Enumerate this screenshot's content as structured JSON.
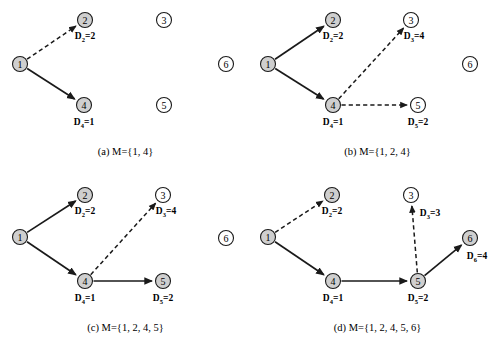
{
  "figure": {
    "colors": {
      "node_filled": "#cfcfcf",
      "node_empty": "#ffffff",
      "stroke": "#1a1a1a",
      "background": "#ffffff"
    },
    "node_radius": 7.5,
    "panels": [
      {
        "id": "a",
        "caption": "(a)  M={1, 4}",
        "nodes": [
          {
            "id": "1",
            "label": "1",
            "x": 20,
            "y": 64,
            "filled": true,
            "dist": null,
            "dist_x": 20,
            "dist_y": 78
          },
          {
            "id": "2",
            "label": "2",
            "x": 85,
            "y": 20,
            "filled": true,
            "dist": "D2=2",
            "dist_sub": "2",
            "dist_val": "2",
            "dist_x": 85,
            "dist_y": 32
          },
          {
            "id": "3",
            "label": "3",
            "x": 164,
            "y": 20,
            "filled": false,
            "dist": null,
            "dist_x": 164,
            "dist_y": 32
          },
          {
            "id": "4",
            "label": "4",
            "x": 84,
            "y": 105,
            "filled": true,
            "dist": "D4=1",
            "dist_sub": "4",
            "dist_val": "1",
            "dist_x": 84,
            "dist_y": 118
          },
          {
            "id": "5",
            "label": "5",
            "x": 164,
            "y": 105,
            "filled": false,
            "dist": null,
            "dist_x": 164,
            "dist_y": 118
          },
          {
            "id": "6",
            "label": "6",
            "x": 226,
            "y": 64,
            "filled": false,
            "dist": null,
            "dist_x": 226,
            "dist_y": 78
          }
        ],
        "edges": [
          {
            "from": "1",
            "to": "2",
            "style": "dashed"
          },
          {
            "from": "1",
            "to": "4",
            "style": "solid"
          }
        ]
      },
      {
        "id": "b",
        "caption": "(b)  M={1, 2, 4}",
        "nodes": [
          {
            "id": "1",
            "label": "1",
            "x": 16,
            "y": 64,
            "filled": true,
            "dist": null,
            "dist_x": 16,
            "dist_y": 78
          },
          {
            "id": "2",
            "label": "2",
            "x": 81,
            "y": 20,
            "filled": true,
            "dist": "D2=2",
            "dist_sub": "2",
            "dist_val": "2",
            "dist_x": 81,
            "dist_y": 32
          },
          {
            "id": "3",
            "label": "3",
            "x": 159,
            "y": 20,
            "filled": false,
            "dist": "D3=4",
            "dist_sub": "3",
            "dist_val": "4",
            "dist_x": 162,
            "dist_y": 32
          },
          {
            "id": "4",
            "label": "4",
            "x": 81,
            "y": 105,
            "filled": true,
            "dist": "D4=1",
            "dist_sub": "4",
            "dist_val": "1",
            "dist_x": 81,
            "dist_y": 118
          },
          {
            "id": "5",
            "label": "5",
            "x": 166,
            "y": 105,
            "filled": false,
            "dist": "D5=2",
            "dist_sub": "5",
            "dist_val": "2",
            "dist_x": 166,
            "dist_y": 118
          },
          {
            "id": "6",
            "label": "6",
            "x": 218,
            "y": 64,
            "filled": false,
            "dist": null,
            "dist_x": 218,
            "dist_y": 78
          }
        ],
        "edges": [
          {
            "from": "1",
            "to": "2",
            "style": "solid"
          },
          {
            "from": "1",
            "to": "4",
            "style": "solid"
          },
          {
            "from": "4",
            "to": "3",
            "style": "dashed"
          },
          {
            "from": "4",
            "to": "5",
            "style": "dashed"
          }
        ]
      },
      {
        "id": "c",
        "caption": "(c)  M={1, 2, 4, 5}",
        "nodes": [
          {
            "id": "1",
            "label": "1",
            "x": 20,
            "y": 61,
            "filled": true,
            "dist": null,
            "dist_x": 20,
            "dist_y": 75
          },
          {
            "id": "2",
            "label": "2",
            "x": 85,
            "y": 19,
            "filled": true,
            "dist": "D2=2",
            "dist_sub": "2",
            "dist_val": "2",
            "dist_x": 85,
            "dist_y": 31
          },
          {
            "id": "3",
            "label": "3",
            "x": 163,
            "y": 19,
            "filled": false,
            "dist": "D3=4",
            "dist_sub": "3",
            "dist_val": "4",
            "dist_x": 166,
            "dist_y": 31
          },
          {
            "id": "4",
            "label": "4",
            "x": 85,
            "y": 105,
            "filled": true,
            "dist": "D4=1",
            "dist_sub": "4",
            "dist_val": "1",
            "dist_x": 85,
            "dist_y": 118
          },
          {
            "id": "5",
            "label": "5",
            "x": 163,
            "y": 105,
            "filled": true,
            "dist": "D5=2",
            "dist_sub": "5",
            "dist_val": "2",
            "dist_x": 163,
            "dist_y": 118
          },
          {
            "id": "6",
            "label": "6",
            "x": 226,
            "y": 62,
            "filled": false,
            "dist": null,
            "dist_x": 226,
            "dist_y": 76
          }
        ],
        "edges": [
          {
            "from": "1",
            "to": "2",
            "style": "solid"
          },
          {
            "from": "1",
            "to": "4",
            "style": "solid"
          },
          {
            "from": "4",
            "to": "3",
            "style": "dashed"
          },
          {
            "from": "4",
            "to": "5",
            "style": "solid"
          }
        ]
      },
      {
        "id": "d",
        "caption": "(d)  M={1, 2, 4, 5, 6}",
        "nodes": [
          {
            "id": "1",
            "label": "1",
            "x": 16,
            "y": 61,
            "filled": true,
            "dist": null,
            "dist_x": 16,
            "dist_y": 75
          },
          {
            "id": "2",
            "label": "2",
            "x": 80,
            "y": 19,
            "filled": true,
            "dist": "D2=2",
            "dist_sub": "2",
            "dist_val": "2",
            "dist_x": 80,
            "dist_y": 31
          },
          {
            "id": "3",
            "label": "3",
            "x": 159,
            "y": 19,
            "filled": false,
            "dist": "D3=3",
            "dist_sub": "3",
            "dist_val": "3",
            "dist_x": 178,
            "dist_y": 33
          },
          {
            "id": "4",
            "label": "4",
            "x": 81,
            "y": 105,
            "filled": true,
            "dist": "D4=1",
            "dist_sub": "4",
            "dist_val": "1",
            "dist_x": 81,
            "dist_y": 118
          },
          {
            "id": "5",
            "label": "5",
            "x": 166,
            "y": 105,
            "filled": true,
            "dist": "D5=2",
            "dist_sub": "5",
            "dist_val": "2",
            "dist_x": 166,
            "dist_y": 118
          },
          {
            "id": "6",
            "label": "6",
            "x": 218,
            "y": 62,
            "filled": true,
            "dist": "D6=4",
            "dist_sub": "6",
            "dist_val": "4",
            "dist_x": 225,
            "dist_y": 76
          }
        ],
        "edges": [
          {
            "from": "1",
            "to": "2",
            "style": "dashed"
          },
          {
            "from": "1",
            "to": "4",
            "style": "solid"
          },
          {
            "from": "4",
            "to": "5",
            "style": "solid"
          },
          {
            "from": "5",
            "to": "3",
            "style": "dashed"
          },
          {
            "from": "5",
            "to": "6",
            "style": "solid"
          }
        ]
      }
    ],
    "panel_origins": [
      {
        "id": "a",
        "left": 0,
        "top": 0
      },
      {
        "id": "b",
        "left": 252,
        "top": 0
      },
      {
        "id": "c",
        "left": 0,
        "top": 176
      },
      {
        "id": "d",
        "left": 252,
        "top": 176
      }
    ],
    "caption_top": 146
  }
}
